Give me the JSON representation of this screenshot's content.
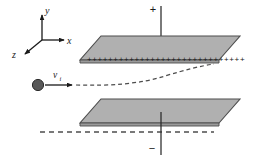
{
  "figure": {
    "background_color": "#ffffff"
  },
  "axes": {
    "origin_label": "",
    "y_label": "y",
    "x_label": "x",
    "z_label": "z",
    "color": "#1a1a1a"
  },
  "terminals": {
    "positive": "+",
    "negative": "−"
  },
  "plates": {
    "fill_color": "#b0b0b0",
    "edge_color": "#4d4d4d",
    "top_plate_name": "positively-charged-plate",
    "bottom_plate_name": "negatively-charged-plate",
    "top_charge_symbols": "++++++++++++++++++++++++++++++",
    "bottom_charge_symbols": "−−−−−−−−−−−−−−−−−−−−−−−−−−−−−−"
  },
  "particle": {
    "label": "v",
    "subscript": "i",
    "fill_color": "#595959",
    "stroke_color": "#2b2b2b"
  },
  "trajectory": {
    "style": "dashed",
    "color": "#4d4d4d"
  }
}
